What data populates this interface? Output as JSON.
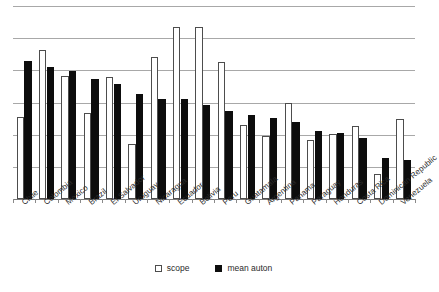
{
  "chart_data": {
    "type": "bar",
    "title": "",
    "subtitle": "",
    "xlabel": "",
    "ylabel": "",
    "ylim": [
      0,
      6
    ],
    "grid": true,
    "gridlines": [
      1,
      2,
      3,
      4,
      5,
      6
    ],
    "legend_position": "bottom-center",
    "categories": [
      "Chile",
      "Colombia",
      "Mexico",
      "Brazil",
      "El Salvador",
      "Uruguay",
      "Nicaragua",
      "Ecuador",
      "Bolivia",
      "Peru",
      "Guatamala",
      "Argentina",
      "Panama",
      "Paraguay",
      "Honduras",
      "Costa Rica",
      "Dominican Republic",
      "Venezuela"
    ],
    "series": [
      {
        "name": "scope",
        "color": "#ffffff",
        "values": [
          2.54,
          4.63,
          3.82,
          2.68,
          3.78,
          1.7,
          4.43,
          5.35,
          5.35,
          4.25,
          2.31,
          1.95,
          3.0,
          1.82,
          2.02,
          2.27,
          0.78,
          2.5
        ]
      },
      {
        "name": "mean auton",
        "color": "#0d0d0d",
        "values": [
          4.28,
          4.1,
          3.98,
          3.73,
          3.58,
          3.25,
          3.1,
          3.1,
          2.92,
          2.75,
          2.6,
          2.52,
          2.38,
          2.1,
          2.05,
          1.9,
          1.28,
          1.22
        ]
      }
    ]
  },
  "legend": {
    "items": [
      {
        "label": "scope",
        "swatch": "open-square-marker"
      },
      {
        "label": "mean auton",
        "swatch": "filled-square-marker"
      }
    ]
  },
  "colors": {
    "scope_fill": "#ffffff",
    "scope_stroke": "#4d4d4d",
    "auton_fill": "#0d0d0d",
    "gridline": "#a8a8a8",
    "axis": "#7a7a7a",
    "text": "#2b2b2b",
    "background": "#ffffff"
  }
}
